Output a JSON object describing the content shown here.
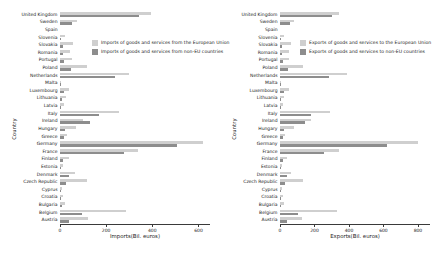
{
  "chart_data": [
    {
      "type": "bar",
      "orientation": "horizontal",
      "title": "",
      "xlabel": "Imports(Bil. euros)",
      "ylabel": "Country",
      "xlim": [
        0,
        650
      ],
      "xticks": [
        0,
        200,
        400,
        600
      ],
      "grid": false,
      "legend_position": "upper-center",
      "categories": [
        "United Kingdom",
        "Sweden",
        "Spain",
        "Slovenia",
        "Slovakia",
        "Romania",
        "Portugal",
        "Poland",
        "Netherlands",
        "Malta",
        "Luxembourg",
        "Lithuania",
        "Latvia",
        "Italy",
        "Ireland",
        "Hungary",
        "Greece",
        "Germany",
        "France",
        "Finland",
        "Estonia",
        "Denmark",
        "Czech Republic",
        "Cyprus",
        "Croatia",
        "Bulgaria",
        "Belgium",
        "Austria"
      ],
      "series": [
        {
          "name": "Imports of goods and services from the European Union",
          "color": "#cfcfcf",
          "values": [
            395,
            74,
            0,
            23,
            58,
            43,
            53,
            118,
            298,
            6,
            37,
            24,
            17,
            257,
            99,
            71,
            32,
            621,
            336,
            40,
            12,
            63,
            117,
            7,
            15,
            23,
            288,
            122
          ]
        },
        {
          "name": "Imports of goods and services from non-EU countries",
          "color": "#8d8d8d",
          "values": [
            342,
            54,
            0,
            6,
            12,
            11,
            17,
            46,
            237,
            3,
            16,
            7,
            4,
            168,
            132,
            20,
            18,
            508,
            277,
            14,
            3,
            40,
            26,
            4,
            4,
            7,
            95,
            40
          ]
        }
      ]
    },
    {
      "type": "bar",
      "orientation": "horizontal",
      "title": "",
      "xlabel": "Exports(Bil. euros)",
      "ylabel": "Country",
      "xlim": [
        0,
        870
      ],
      "xticks": [
        0,
        200,
        400,
        600,
        800
      ],
      "grid": false,
      "legend_position": "upper-center",
      "categories": [
        "United Kingdom",
        "Sweden",
        "Spain",
        "Slovenia",
        "Slovakia",
        "Romania",
        "Portugal",
        "Poland",
        "Netherlands",
        "Malta",
        "Luxembourg",
        "Lithuania",
        "Latvia",
        "Italy",
        "Ireland",
        "Hungary",
        "Greece",
        "Germany",
        "France",
        "Finland",
        "Estonia",
        "Denmark",
        "Czech Republic",
        "Cyprus",
        "Croatia",
        "Bulgaria",
        "Belgium",
        "Austria"
      ],
      "series": [
        {
          "name": "Exports of goods and services to the European Union",
          "color": "#cfcfcf",
          "values": [
            345,
            80,
            0,
            25,
            63,
            50,
            53,
            133,
            391,
            8,
            55,
            25,
            17,
            288,
            180,
            79,
            28,
            800,
            345,
            41,
            13,
            66,
            133,
            10,
            15,
            25,
            330,
            125
          ]
        },
        {
          "name": "Exports of goods and services to non-EU countries",
          "color": "#8d8d8d",
          "values": [
            300,
            57,
            0,
            6,
            11,
            11,
            17,
            46,
            285,
            4,
            22,
            8,
            5,
            180,
            146,
            21,
            15,
            620,
            255,
            16,
            4,
            42,
            27,
            5,
            4,
            8,
            104,
            42
          ]
        }
      ]
    }
  ],
  "legend": {
    "left": [
      "Imports of goods and services from the European Union",
      "Imports of goods and services from non-EU countries"
    ],
    "right": [
      "Exports of goods and services to the European Union",
      "Exports of goods and services to non-EU countries"
    ]
  }
}
